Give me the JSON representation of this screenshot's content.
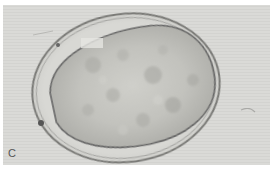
{
  "figure": {
    "panel_label": "C",
    "colors": {
      "background": "#d9d9d6",
      "shell_outline": "#6b6b6b",
      "interior": "#bdbdb8",
      "label": "#555555"
    }
  }
}
